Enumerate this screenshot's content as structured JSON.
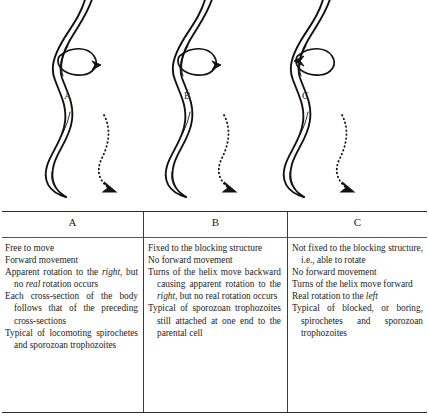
{
  "figure": {
    "panels": [
      {
        "id": "A",
        "label": "A",
        "rotation_arrow_direction": "right",
        "motion_arrow_direction": "down-right",
        "body_shape": "helical-double-line-spirochete"
      },
      {
        "id": "B",
        "label": "B",
        "rotation_arrow_direction": "right",
        "motion_arrow_direction": "down-right",
        "body_shape": "helical-double-line-spirochete"
      },
      {
        "id": "C",
        "label": "C",
        "rotation_arrow_direction": "left",
        "motion_arrow_direction": "down-right",
        "body_shape": "helical-double-line-spirochete"
      }
    ],
    "ink_color": "#111111"
  },
  "table": {
    "headers": [
      "A",
      "B",
      "C"
    ],
    "columns": [
      {
        "header": "A",
        "entries": [
          [
            {
              "t": "Free to move"
            }
          ],
          [
            {
              "t": "Forward movement"
            }
          ],
          [
            {
              "t": "Apparent rotation to the "
            },
            {
              "t": "right",
              "i": true
            },
            {
              "t": ", but no "
            },
            {
              "t": "real",
              "i": true
            },
            {
              "t": " rotation occurs"
            }
          ],
          [
            {
              "t": "Each cross-section of the body follows that of the preceding cross-sections"
            }
          ],
          [
            {
              "t": "Typical of locomoting spirochetes and sporozoan trophozoites"
            }
          ]
        ]
      },
      {
        "header": "B",
        "entries": [
          [
            {
              "t": "Fixed to the blocking structure"
            }
          ],
          [
            {
              "t": "No forward movement"
            }
          ],
          [
            {
              "t": "Turns of the helix move backward causing apparent rotation to the "
            },
            {
              "t": "right",
              "i": true
            },
            {
              "t": ", but no real rotation occurs"
            }
          ],
          [
            {
              "t": "Typical of sporozoan trophozoites still attached at one end to the parental cell"
            }
          ]
        ]
      },
      {
        "header": "C",
        "entries": [
          [
            {
              "t": "Not fixed to the blocking structure, i.e., able to rotate"
            }
          ],
          [
            {
              "t": "No forward movement"
            }
          ],
          [
            {
              "t": "Turns of the helix move forward"
            }
          ],
          [
            {
              "t": "Real rotation to the "
            },
            {
              "t": "left",
              "i": true
            }
          ],
          [
            {
              "t": "Typical of blocked, or boring, spirochetes and sporozoan trophozoites"
            }
          ]
        ]
      }
    ]
  }
}
